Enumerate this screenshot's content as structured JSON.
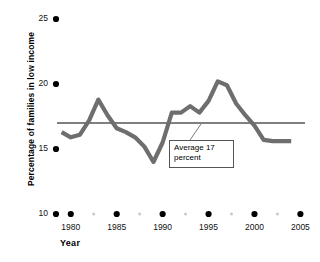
{
  "chart_data": {
    "type": "line",
    "title": "",
    "xlabel": "Year",
    "ylabel": "Percentage of families in low income",
    "xlim": [
      1978.5,
      2005.5
    ],
    "ylim": [
      10,
      25
    ],
    "grid": false,
    "legend": "none",
    "x_ticks": [
      1980,
      1985,
      1990,
      1995,
      2000,
      2005
    ],
    "x_tick_labels": [
      "1980",
      "1985",
      "1990",
      "1995",
      "2000",
      "2005"
    ],
    "y_ticks": [
      10,
      15,
      20,
      25
    ],
    "y_tick_labels": [
      "10",
      "15",
      "20",
      "25"
    ],
    "series": [
      {
        "name": "Percentage of families in low income",
        "color": "#6e6e6e",
        "x": [
          1979,
          1980,
          1981,
          1982,
          1983,
          1984,
          1985,
          1986,
          1987,
          1988,
          1989,
          1990,
          1991,
          1992,
          1993,
          1994,
          1995,
          1996,
          1997,
          1998,
          1999,
          2000,
          2001,
          2002,
          2003,
          2004
        ],
        "values": [
          16.3,
          15.9,
          16.1,
          17.2,
          18.8,
          17.6,
          16.6,
          16.3,
          15.9,
          15.2,
          14.0,
          15.5,
          17.8,
          17.8,
          18.3,
          17.8,
          18.7,
          20.2,
          19.9,
          18.5,
          17.6,
          16.8,
          15.7,
          15.6,
          15.6,
          15.6
        ]
      }
    ],
    "reference_line": {
      "name": "average",
      "value": 17,
      "color": "#000000",
      "label_line_1": "Average 17",
      "label_line_2": "percent"
    }
  },
  "annotations": {
    "callout": {
      "line1": "Average 17",
      "line2": "percent"
    }
  },
  "axes": {
    "y_title": "Percentage of families in low income",
    "x_title": "Year"
  }
}
